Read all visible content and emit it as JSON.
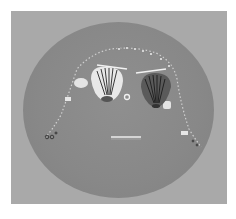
{
  "image": {
    "description": "Grayscale photograph of a face arranged from seashells, sticks, beads and a ring on a round disc",
    "colors": {
      "margin": "#ffffff",
      "background": "#a9a9a9",
      "disc": "#888888",
      "shell_light": "#e8e8e8",
      "shell_dark": "#3a3a3a",
      "stick": "#f2f2f2",
      "bead": "#d8d8d8"
    },
    "elements": {
      "left_eye": "scallop-shell-light",
      "right_eye": "scallop-shell-dark",
      "left_eyebrow": "stick",
      "right_eyebrow": "stick",
      "nose": "small-ring",
      "mouth": "stick",
      "hair": "bead-string-arc",
      "cheek_left": "white-pebble",
      "cheek_right": "white-pebble"
    }
  }
}
